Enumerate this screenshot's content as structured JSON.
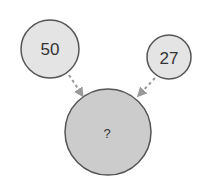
{
  "diagram": {
    "nodes": [
      {
        "id": "left",
        "label": "50",
        "fill": "#e4e4e4",
        "stroke": "#555555"
      },
      {
        "id": "right",
        "label": "27",
        "fill": "#e4e4e4",
        "stroke": "#555555"
      },
      {
        "id": "result",
        "label": "?",
        "fill": "#cccccc",
        "stroke": "#555555"
      }
    ],
    "edges": [
      {
        "from": "left",
        "to": "result",
        "style": "dashed",
        "color": "#999999"
      },
      {
        "from": "right",
        "to": "result",
        "style": "dashed",
        "color": "#999999"
      }
    ]
  }
}
